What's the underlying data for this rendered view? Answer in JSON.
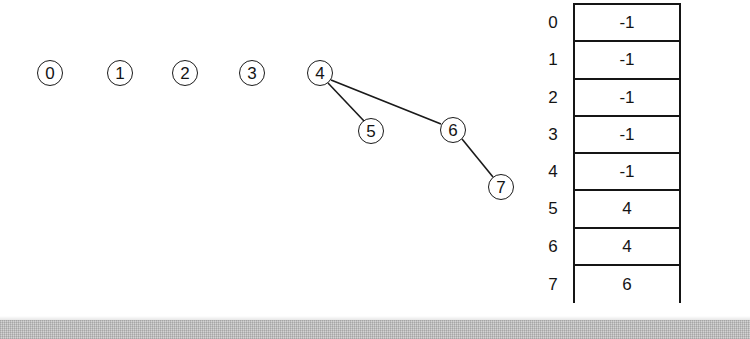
{
  "figure": {
    "background_color": "#ffffff",
    "ink_color": "#141414"
  },
  "graph": {
    "nodes": [
      {
        "id": "0",
        "label": "0",
        "cx": 50,
        "cy": 73,
        "r": 13
      },
      {
        "id": "1",
        "label": "1",
        "cx": 120,
        "cy": 73,
        "r": 13
      },
      {
        "id": "2",
        "label": "2",
        "cx": 185,
        "cy": 73,
        "r": 13
      },
      {
        "id": "3",
        "label": "3",
        "cx": 252,
        "cy": 73,
        "r": 13
      },
      {
        "id": "4",
        "label": "4",
        "cx": 320,
        "cy": 73,
        "r": 13
      },
      {
        "id": "5",
        "label": "5",
        "cx": 371,
        "cy": 131,
        "r": 13
      },
      {
        "id": "6",
        "label": "6",
        "cx": 453,
        "cy": 130,
        "r": 13
      },
      {
        "id": "7",
        "label": "7",
        "cx": 501,
        "cy": 187,
        "r": 13
      }
    ],
    "edges": [
      {
        "from": "4",
        "to": "5",
        "x1": 328,
        "y1": 83,
        "x2": 364,
        "y2": 121
      },
      {
        "from": "4",
        "to": "6",
        "x1": 331,
        "y1": 80,
        "x2": 441,
        "y2": 124
      },
      {
        "from": "6",
        "to": "7",
        "x1": 462,
        "y1": 139,
        "x2": 493,
        "y2": 177
      }
    ]
  },
  "array": {
    "name": "parent",
    "rows": [
      {
        "index": "0",
        "value": "-1"
      },
      {
        "index": "1",
        "value": "-1"
      },
      {
        "index": "2",
        "value": "-1"
      },
      {
        "index": "3",
        "value": "-1"
      },
      {
        "index": "4",
        "value": "-1"
      },
      {
        "index": "5",
        "value": "4"
      },
      {
        "index": "6",
        "value": "4"
      },
      {
        "index": "7",
        "value": "6"
      }
    ]
  },
  "chart_data": {
    "type": "diagram",
    "nodes": [
      "0",
      "1",
      "2",
      "3",
      "4",
      "5",
      "6",
      "7"
    ],
    "edges": [
      [
        "4",
        "5"
      ],
      [
        "4",
        "6"
      ],
      [
        "6",
        "7"
      ]
    ],
    "roots": [
      "0",
      "1",
      "2",
      "3",
      "4"
    ],
    "parent_array": {
      "indices": [
        0,
        1,
        2,
        3,
        4,
        5,
        6,
        7
      ],
      "values": [
        -1,
        -1,
        -1,
        -1,
        -1,
        4,
        4,
        6
      ]
    },
    "legend": [],
    "annotations": []
  }
}
